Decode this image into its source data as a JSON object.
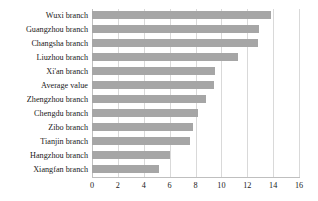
{
  "chart_data": {
    "type": "bar",
    "orientation": "horizontal",
    "title": "",
    "subtitle": "",
    "xlabel": "",
    "ylabel": "",
    "xlim": [
      0,
      16
    ],
    "xticks": [
      "0",
      "2",
      "4",
      "6",
      "8",
      "10",
      "12",
      "14",
      "16"
    ],
    "xtick_step": 2,
    "grid": "vertical",
    "legend": "none",
    "bar_color": "#a6a6a6",
    "grid_color": "#d9d9d9",
    "axis_color": "#bfbfbf",
    "text_color": "#1a1a1a",
    "categories": [
      "Wuxi branch",
      "Guangzhou branch",
      "Changsha branch",
      "Liuzhou branch",
      "Xi'an branch",
      "Average value",
      "Zhengzhou branch",
      "Chengdu branch",
      "Zibo branch",
      "Tianjin branch",
      "Hangzhou branch",
      "Xiangfan branch"
    ],
    "values": [
      13.8,
      12.9,
      12.8,
      11.3,
      9.5,
      9.4,
      8.8,
      8.2,
      7.8,
      7.6,
      6.0,
      5.2
    ]
  }
}
